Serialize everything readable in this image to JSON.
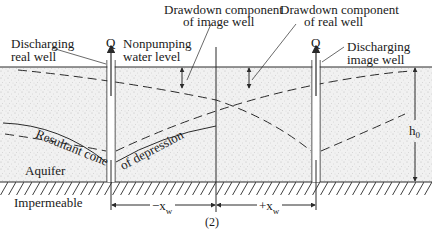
{
  "figure": {
    "caption": "(2)",
    "labels": {
      "discharging_real_well_1": "Discharging",
      "discharging_real_well_2": "real well",
      "nonpumping_1": "Nonpumping",
      "nonpumping_2": "water level",
      "drawdown_image_1": "Drawdown component",
      "drawdown_image_2": "of image well",
      "drawdown_real_1": "Drawdown component",
      "drawdown_real_2": "of real well",
      "discharging_image_well_1": "Discharging",
      "discharging_image_well_2": "image well",
      "q_real": "Q",
      "q_image": "Q",
      "h0": "h",
      "h0_sub": "0",
      "resultant_cone": "Resultant cone",
      "of_depression": "of depression",
      "aquifer": "Aquifer",
      "impermeable": "Impermeable",
      "minus_xw": "−x",
      "plus_xw": "+x",
      "xw_sub": "w"
    },
    "colors": {
      "line": "#2a2a2a",
      "stipple_bg": "#f1f1f1",
      "stipple_dot": "#b9b9b9",
      "background": "#ffffff"
    }
  }
}
